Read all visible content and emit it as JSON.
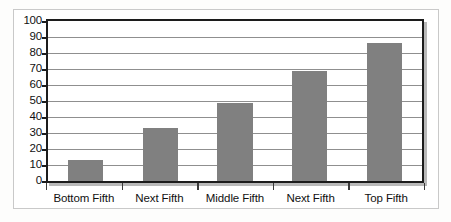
{
  "chart_data": {
    "type": "bar",
    "title": "",
    "subtitle": "",
    "xlabel": "",
    "ylabel": "",
    "categories": [
      "Bottom Fifth",
      "Next Fifth",
      "Middle Fifth",
      "Next Fifth",
      "Top Fifth"
    ],
    "values": [
      13,
      33,
      49,
      69,
      86
    ],
    "series": [
      {
        "name": "",
        "values": [
          13,
          33,
          49,
          69,
          86
        ]
      }
    ],
    "ylim": [
      0,
      100
    ],
    "ytick_labels": [
      "100",
      "90",
      "80",
      "70",
      "60",
      "50",
      "40",
      "30",
      "20",
      "10",
      "0"
    ],
    "ytick_values": [
      100,
      90,
      80,
      70,
      60,
      50,
      40,
      30,
      20,
      10,
      0
    ],
    "ytick_step": 10,
    "grid": true,
    "grid_axis": "y",
    "legend": false,
    "legend_position": "none",
    "annotations": []
  },
  "style": {
    "bar_color": "#808080",
    "gridline_color": "#8f8f8f",
    "plot_border_color": "#1c1c1c",
    "outer_frame_color": "#c9c9c9",
    "shadow_color": "#b9b9b9",
    "page_background": "#fdfdfc",
    "plot_background": "#ffffff",
    "text_color": "#111111"
  }
}
